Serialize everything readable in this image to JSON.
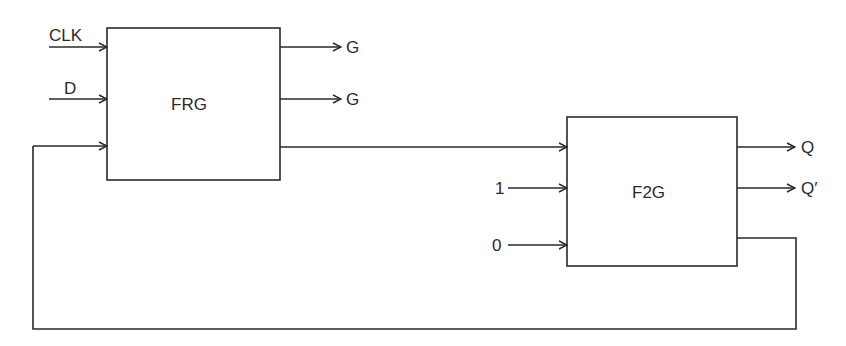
{
  "diagram": {
    "blocks": [
      {
        "id": "frg",
        "label": "FRG",
        "inputs": [
          "CLK",
          "D",
          "feedback"
        ],
        "outputs": [
          "G",
          "G",
          "to F2G"
        ]
      },
      {
        "id": "f2g",
        "label": "F2G",
        "inputs": [
          "from FRG",
          "1",
          "0"
        ],
        "outputs": [
          "Q",
          "Q′",
          "feedback"
        ]
      }
    ],
    "labels": {
      "clk": "CLK",
      "d": "D",
      "g1": "G",
      "g2": "G",
      "one": "1",
      "zero": "0",
      "q": "Q",
      "qbar": "Q′"
    },
    "colors": {
      "stroke": "#2a2a2a",
      "background": "#ffffff"
    }
  }
}
